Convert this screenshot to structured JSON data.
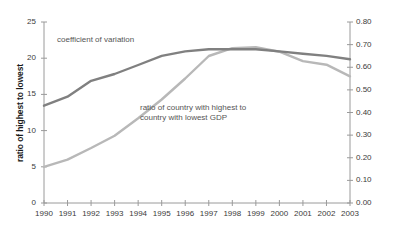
{
  "chart_data": {
    "type": "line",
    "title": "",
    "xlabel": "",
    "x": [
      1990,
      1991,
      1992,
      1993,
      1994,
      1995,
      1996,
      1997,
      1998,
      1999,
      2000,
      2001,
      2002,
      2003
    ],
    "xtick_labels": [
      "1990",
      "1991",
      "1992",
      "1993",
      "1994",
      "1995",
      "1996",
      "1997",
      "1998",
      "1999",
      "2000",
      "2001",
      "2002",
      "2003"
    ],
    "grid": false,
    "legend_position": "inline-annotations",
    "axes": [
      {
        "id": "left",
        "label": "ratio of highest to lowest",
        "ylim": [
          0,
          25
        ],
        "ytick_labels": [
          "0",
          "5",
          "10",
          "15",
          "20",
          "25"
        ],
        "ytick_values": [
          0,
          5,
          10,
          15,
          20,
          25
        ]
      },
      {
        "id": "right",
        "label": "coefficient of variation",
        "ylim": [
          0.0,
          0.8
        ],
        "ytick_labels": [
          "0.00",
          "0.10",
          "0.20",
          "0.30",
          "0.40",
          "0.50",
          "0.60",
          "0.70",
          "0.80"
        ],
        "ytick_values": [
          0.0,
          0.1,
          0.2,
          0.3,
          0.4,
          0.5,
          0.6,
          0.7,
          0.8
        ]
      }
    ],
    "series": [
      {
        "name": "coefficient of variation",
        "axis": "right",
        "color": "#808080",
        "annotation": "coefficient of variation",
        "values": [
          0.43,
          0.47,
          0.54,
          0.57,
          0.61,
          0.65,
          0.67,
          0.68,
          0.68,
          0.68,
          0.67,
          0.66,
          0.65,
          0.635
        ]
      },
      {
        "name": "ratio of country with highest to country with lowest GDP",
        "axis": "left",
        "color": "#b8b8b8",
        "annotation": "ratio of country with highest to\ncountry with lowest GDP",
        "annotation_line_1": "ratio of country with highest to",
        "annotation_line_2": "country with lowest GDP",
        "values": [
          5.0,
          6.0,
          7.6,
          9.3,
          11.7,
          14.3,
          17.2,
          20.3,
          21.4,
          21.5,
          20.9,
          19.6,
          19.1,
          17.5
        ]
      }
    ]
  }
}
